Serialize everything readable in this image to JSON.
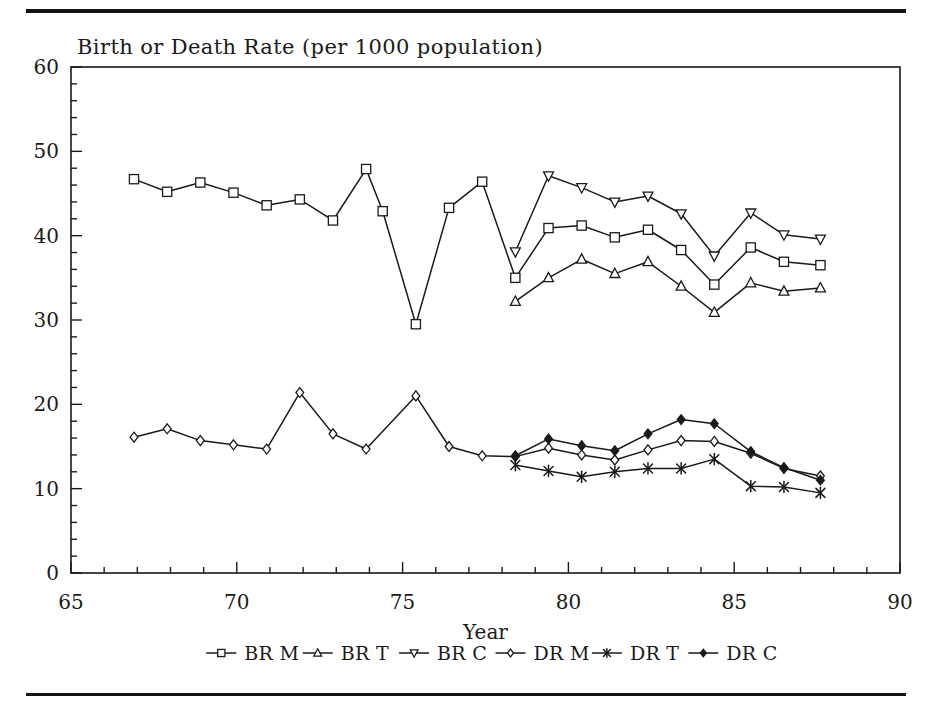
{
  "figure": {
    "rule_color": "#141414",
    "background": "#ffffff"
  },
  "chart_data": {
    "type": "line",
    "title": "Birth or Death Rate (per 1000 population)",
    "xlabel": "Year",
    "ylabel": "",
    "xlim": [
      65,
      90
    ],
    "ylim": [
      0,
      60
    ],
    "x_major_ticks": [
      65,
      70,
      75,
      80,
      85,
      90
    ],
    "x_minor_step": 1,
    "y_major_ticks": [
      0,
      10,
      20,
      30,
      40,
      50,
      60
    ],
    "y_minor_step": 2,
    "x_tick_labels": [
      "65",
      "70",
      "75",
      "80",
      "85",
      "90"
    ],
    "y_tick_labels": [
      "0",
      "10",
      "20",
      "30",
      "40",
      "50",
      "60"
    ],
    "grid": false,
    "legend_position": "below-axis",
    "line_color": "#1a1a1a",
    "series": [
      {
        "name": "BR M",
        "marker": "square-open",
        "points": [
          [
            66.9,
            46.7
          ],
          [
            67.9,
            45.2
          ],
          [
            68.9,
            46.3
          ],
          [
            69.9,
            45.1
          ],
          [
            70.9,
            43.6
          ],
          [
            71.9,
            44.3
          ],
          [
            72.9,
            41.8
          ],
          [
            73.9,
            47.9
          ],
          [
            74.4,
            42.9
          ],
          [
            75.4,
            29.5
          ],
          [
            76.4,
            43.3
          ],
          [
            77.4,
            46.4
          ],
          [
            78.4,
            35.0
          ],
          [
            79.4,
            40.9
          ],
          [
            80.4,
            41.2
          ],
          [
            81.4,
            39.8
          ],
          [
            82.4,
            40.7
          ],
          [
            83.4,
            38.3
          ],
          [
            84.4,
            34.2
          ],
          [
            85.5,
            38.6
          ],
          [
            86.5,
            36.9
          ],
          [
            87.6,
            36.5
          ]
        ]
      },
      {
        "name": "BR T",
        "marker": "triangle-up-open",
        "points": [
          [
            78.4,
            32.2
          ],
          [
            79.4,
            35.0
          ],
          [
            80.4,
            37.2
          ],
          [
            81.4,
            35.5
          ],
          [
            82.4,
            36.9
          ],
          [
            83.4,
            34.0
          ],
          [
            84.4,
            30.9
          ],
          [
            85.5,
            34.4
          ],
          [
            86.5,
            33.4
          ],
          [
            87.6,
            33.8
          ]
        ]
      },
      {
        "name": "BR C",
        "marker": "triangle-down-open",
        "points": [
          [
            78.4,
            38.1
          ],
          [
            79.4,
            47.1
          ],
          [
            80.4,
            45.7
          ],
          [
            81.4,
            44.0
          ],
          [
            82.4,
            44.7
          ],
          [
            83.4,
            42.6
          ],
          [
            84.4,
            37.6
          ],
          [
            85.5,
            42.7
          ],
          [
            86.5,
            40.1
          ],
          [
            87.6,
            39.6
          ]
        ]
      },
      {
        "name": "DR M",
        "marker": "diamond-open",
        "points": [
          [
            66.9,
            16.1
          ],
          [
            67.9,
            17.1
          ],
          [
            68.9,
            15.7
          ],
          [
            69.9,
            15.2
          ],
          [
            70.9,
            14.7
          ],
          [
            71.9,
            21.4
          ],
          [
            72.9,
            16.5
          ],
          [
            73.9,
            14.7
          ],
          [
            75.4,
            21.0
          ],
          [
            76.4,
            15.0
          ],
          [
            77.4,
            13.9
          ],
          [
            78.4,
            13.8
          ],
          [
            79.4,
            14.8
          ],
          [
            80.4,
            14.0
          ],
          [
            81.4,
            13.4
          ],
          [
            82.4,
            14.6
          ],
          [
            83.4,
            15.7
          ],
          [
            84.4,
            15.6
          ],
          [
            85.5,
            14.2
          ],
          [
            86.5,
            12.4
          ],
          [
            87.6,
            11.5
          ]
        ]
      },
      {
        "name": "DR T",
        "marker": "star",
        "points": [
          [
            78.4,
            12.8
          ],
          [
            79.4,
            12.1
          ],
          [
            80.4,
            11.4
          ],
          [
            81.4,
            12.0
          ],
          [
            82.4,
            12.4
          ],
          [
            83.4,
            12.4
          ],
          [
            84.4,
            13.5
          ],
          [
            85.5,
            10.3
          ],
          [
            86.5,
            10.2
          ],
          [
            87.6,
            9.5
          ]
        ]
      },
      {
        "name": "DR C",
        "marker": "diamond-filled",
        "points": [
          [
            78.4,
            13.9
          ],
          [
            79.4,
            15.9
          ],
          [
            80.4,
            15.1
          ],
          [
            81.4,
            14.5
          ],
          [
            82.4,
            16.5
          ],
          [
            83.4,
            18.2
          ],
          [
            84.4,
            17.7
          ],
          [
            85.5,
            14.4
          ],
          [
            86.5,
            12.5
          ],
          [
            87.6,
            11.0
          ]
        ]
      }
    ]
  },
  "legend": {
    "entries": [
      {
        "label": "BR M",
        "marker": "square-open"
      },
      {
        "label": "BR T",
        "marker": "triangle-up-open"
      },
      {
        "label": "BR C",
        "marker": "triangle-down-open"
      },
      {
        "label": "DR M",
        "marker": "diamond-open"
      },
      {
        "label": "DR T",
        "marker": "star"
      },
      {
        "label": "DR C",
        "marker": "diamond-filled"
      }
    ]
  }
}
